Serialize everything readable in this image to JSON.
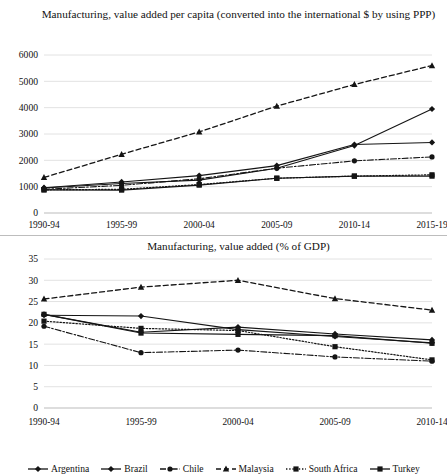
{
  "chart_data": [
    {
      "type": "line",
      "title": "Manufacturing, value added per capita (converted into the international $ by using PPP)",
      "xlabel": "",
      "ylabel": "",
      "categories": [
        "1990-94",
        "1995-99",
        "2000-04",
        "2005-09",
        "2010-14",
        "2015-19"
      ],
      "ylim": [
        0,
        6000
      ],
      "yticks": [
        0,
        1000,
        2000,
        3000,
        4000,
        5000,
        6000
      ],
      "ytick_labels": [
        "0",
        "1000",
        "2000",
        "3000",
        "4000",
        "5000",
        "6000"
      ],
      "grid": true,
      "legend_position": "bottom",
      "series": [
        {
          "name": "Argentina",
          "values": [
            950,
            1120,
            1250,
            1700,
            2560,
            3950
          ]
        },
        {
          "name": "Brazil",
          "values": [
            960,
            1180,
            1420,
            1800,
            2600,
            2680
          ]
        },
        {
          "name": "Chile",
          "values": [
            900,
            1050,
            1300,
            1700,
            1980,
            2130
          ]
        },
        {
          "name": "Malaysia",
          "values": [
            1350,
            2230,
            3080,
            4060,
            4880,
            5600
          ]
        },
        {
          "name": "South Africa",
          "values": [
            880,
            900,
            1080,
            1320,
            1400,
            1450
          ]
        },
        {
          "name": "Turkey",
          "values": [
            880,
            870,
            1060,
            1320,
            1400,
            1400
          ]
        }
      ]
    },
    {
      "type": "line",
      "title": "Manufacturing, value added (% of GDP)",
      "xlabel": "",
      "ylabel": "",
      "categories": [
        "1990-94",
        "1995-99",
        "2000-04",
        "2005-09",
        "2010-14"
      ],
      "ylim": [
        0,
        35
      ],
      "yticks": [
        0,
        5,
        10,
        15,
        20,
        25,
        30,
        35
      ],
      "ytick_labels": [
        "0",
        "5",
        "10",
        "15",
        "20",
        "25",
        "30",
        "35"
      ],
      "grid": true,
      "legend_position": "bottom",
      "series": [
        {
          "name": "Argentina",
          "values": [
            22.0,
            17.8,
            19.0,
            17.4,
            16.0
          ]
        },
        {
          "name": "Brazil",
          "values": [
            21.8,
            21.6,
            18.4,
            16.8,
            15.3
          ]
        },
        {
          "name": "Chile",
          "values": [
            19.2,
            13.0,
            13.6,
            12.0,
            11.0
          ]
        },
        {
          "name": "Malaysia",
          "values": [
            25.6,
            28.4,
            30.0,
            25.7,
            23.0
          ]
        },
        {
          "name": "South Africa",
          "values": [
            20.4,
            18.7,
            18.2,
            14.4,
            11.3
          ]
        },
        {
          "name": "Turkey",
          "values": [
            22.0,
            17.6,
            17.3,
            17.0,
            15.2
          ]
        }
      ]
    }
  ],
  "legend": {
    "items": [
      {
        "label": "Argentina",
        "style": "solid",
        "marker": "diamond"
      },
      {
        "label": "Brazil",
        "style": "solid",
        "marker": "diamond"
      },
      {
        "label": "Chile",
        "style": "dashdot",
        "marker": "circle"
      },
      {
        "label": "Malaysia",
        "style": "dashed",
        "marker": "triangle"
      },
      {
        "label": "South Africa",
        "style": "dotted",
        "marker": "square"
      },
      {
        "label": "Turkey",
        "style": "solid",
        "marker": "square"
      }
    ]
  },
  "colors": {
    "line": "#141414",
    "grid": "#e2e2e2",
    "text": "#111111"
  }
}
